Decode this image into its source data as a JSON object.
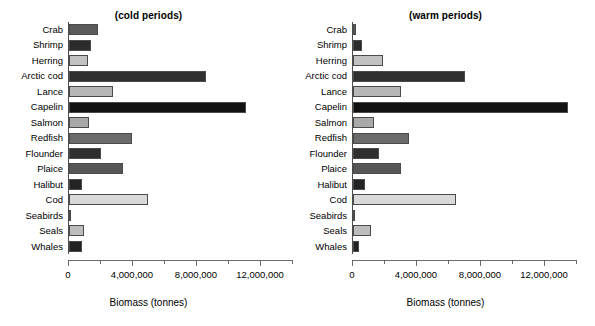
{
  "figure": {
    "axis_title": "Biomass (tonnes)"
  },
  "chart_data": {
    "type": "bar",
    "title": "",
    "xlabel": "Biomass (tonnes)",
    "ylabel": "",
    "orientation": "horizontal",
    "xlim": [
      0,
      14000000
    ],
    "xticks": [
      0,
      4000000,
      8000000,
      12000000
    ],
    "xtick_labels": [
      "0",
      "4,000,000",
      "8,000,000",
      "12,000,000"
    ],
    "minor_xticks": [
      2000000,
      6000000,
      10000000,
      14000000
    ],
    "grid": false,
    "legend": "none",
    "categories": [
      "Crab",
      "Shrimp",
      "Herring",
      "Arctic cod",
      "Lance",
      "Capelin",
      "Salmon",
      "Redfish",
      "Flounder",
      "Plaice",
      "Halibut",
      "Cod",
      "Seabirds",
      "Seals",
      "Whales"
    ],
    "category_colors": [
      "#5b5b5b",
      "#2b2b2b",
      "#c2c2c2",
      "#303030",
      "#b6b6b6",
      "#121212",
      "#a9a9a9",
      "#6b6b6b",
      "#2e2e2e",
      "#565656",
      "#242424",
      "#d9d9d9",
      "#707070",
      "#bdbdbd",
      "#222222"
    ],
    "panels": [
      {
        "name": "cold",
        "title": "(cold periods)",
        "values": [
          1810000,
          1350000,
          1190000,
          8560000,
          2750000,
          11040000,
          1230000,
          3940000,
          1960000,
          3370000,
          770000,
          4900000,
          20000,
          940000,
          810000
        ]
      },
      {
        "name": "warm",
        "title": "(warm periods)",
        "values": [
          160000,
          560000,
          1870000,
          6950000,
          2950000,
          13400000,
          1280000,
          3470000,
          1590000,
          2950000,
          750000,
          6430000,
          20000,
          1130000,
          370000
        ]
      }
    ]
  }
}
